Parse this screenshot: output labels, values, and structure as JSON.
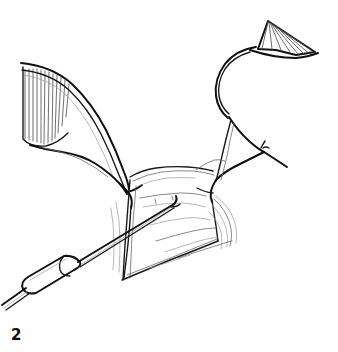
{
  "figure": {
    "caption_label": "2",
    "style": "black ink line art on white background, hand-drawn medical illustration",
    "background_color": "#ffffff",
    "ink_color": "#111111",
    "canvas": {
      "width": 338,
      "height": 352
    }
  },
  "elements": {
    "left_retractor": {
      "name": "left-retractor",
      "description": "Broad ribbon retractor entering from upper left, hatched blade, curving down-right to a narrow hooked tip engaging the tissue edge",
      "blade_hatch_line_count": 12,
      "blade_top_left": [
        22,
        66
      ],
      "tip_point": [
        128,
        188
      ]
    },
    "right_retractor": {
      "name": "right-retractor",
      "description": "Curved retractor entering from upper right with a triangular hatched fan at its top, arcing down-left to a pointed tip on the tissue edge",
      "fan_hatch_line_count": 8,
      "fan_apex": [
        268,
        21
      ],
      "tip_point": [
        212,
        191
      ]
    },
    "probe": {
      "name": "surgical-probe",
      "description": "Slender straight probe with a rounded handle collar, entering from lower left and reaching a small hooked tip in the centre of the tissue flap",
      "handle_collar_from": [
        22,
        287
      ],
      "handle_collar_to": [
        78,
        262
      ],
      "tip_point": [
        176,
        203
      ]
    },
    "tissue_flap": {
      "name": "tissue-flap",
      "description": "Raised quadrilateral tissue flap held open between the two retractors, with sketchy surface contour strokes and shaded folds on the right",
      "top_edge_from": [
        131,
        172
      ],
      "top_edge_to": [
        216,
        166
      ],
      "bottom_edge_from": [
        122,
        281
      ],
      "bottom_edge_to": [
        224,
        239
      ]
    },
    "suture_mark": {
      "name": "suture-thread-mark",
      "description": "Short thread / tick mark on the right instrument shaft",
      "position": [
        262,
        150
      ]
    }
  }
}
